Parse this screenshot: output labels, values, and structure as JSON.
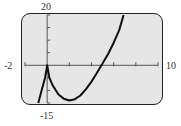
{
  "window": {
    "xmin": "-2",
    "xmax": "10",
    "ymin": "-15",
    "ymax": "20"
  },
  "chart_data": {
    "type": "line",
    "title": "",
    "xlabel": "",
    "ylabel": "",
    "xlim": [
      -2,
      10
    ],
    "ylim": [
      -15,
      20
    ],
    "xticks_step": 2,
    "yticks_step": 5,
    "grid": false,
    "series": [
      {
        "name": "f(x)",
        "x": [
          -0.8,
          -0.5,
          -0.2,
          0,
          0.2,
          0.5,
          1,
          1.5,
          2,
          2.5,
          3,
          3.5,
          4,
          4.5,
          4.9,
          5.5,
          6,
          6.5,
          6.9
        ],
        "y": [
          -15,
          -10,
          -5,
          0,
          -5,
          -8,
          -11.5,
          -13.3,
          -14,
          -13.5,
          -12,
          -9.5,
          -6.5,
          -3,
          0,
          4.5,
          9,
          14,
          20
        ]
      }
    ]
  }
}
